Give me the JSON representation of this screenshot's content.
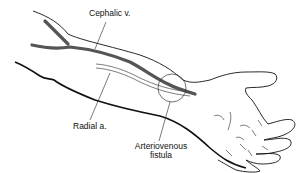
{
  "figure": {
    "type": "anatomical-illustration"
  },
  "labels": {
    "cephalic_vein": "Cephalic v.",
    "radial_artery": "Radial a.",
    "fistula_line1": "Arteriovenous",
    "fistula_line2": "fistula"
  },
  "colors": {
    "outline": "#111111",
    "vein": "#555555",
    "artery": "#777777",
    "background": "#ffffff"
  }
}
